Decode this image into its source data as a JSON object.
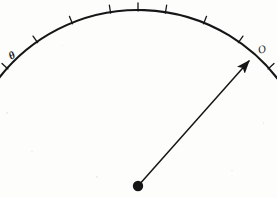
{
  "figure": {
    "kind": "line-drawing",
    "caption": "Circular arc scale with tick marks and a radial pointer arrow from a pivot",
    "background_color": "#fdfdfc",
    "ink_color": "#161616"
  },
  "labels": {
    "left_end": "θ",
    "right_end": "O"
  },
  "chart_data": {
    "type": "scatter",
    "title": "",
    "xlabel": "",
    "ylabel": "",
    "xlim": [
      0,
      277
    ],
    "ylim": [
      198,
      0
    ],
    "grid": false,
    "legend": null,
    "arc": {
      "name": "graduated-arc",
      "center": [
        138,
        186
      ],
      "radius": 176,
      "start_angle_deg": 143,
      "end_angle_deg": 33,
      "start_point": [
        22,
        62
      ],
      "apex_point": [
        137,
        11
      ],
      "end_point": [
        250,
        58
      ],
      "stroke_width": 2.1
    },
    "ticks": {
      "count": 9,
      "length": 7,
      "direction": "outward",
      "stroke_width": 1.3,
      "angles_deg": [
        138,
        125,
        112,
        99,
        90,
        81,
        68,
        55,
        42
      ]
    },
    "pointer": {
      "name": "pointer-arrow",
      "from": [
        138,
        186
      ],
      "to": [
        249,
        61
      ],
      "stroke_width": 1.5,
      "arrowhead": true,
      "arrowhead_length": 11,
      "arrowhead_halfwidth": 3.4
    },
    "pivot": {
      "name": "pivot-dot",
      "center": [
        138,
        186
      ],
      "radius": 5.2,
      "filled": true
    },
    "annotations": [
      {
        "text": "θ",
        "x": 13,
        "y": 56,
        "rotation_deg": -28
      },
      {
        "text": "O",
        "x": 262,
        "y": 50,
        "rotation_deg": -18
      }
    ]
  }
}
